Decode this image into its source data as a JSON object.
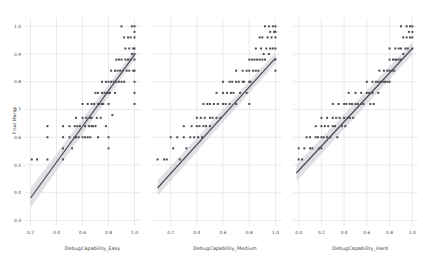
{
  "figure": {
    "background_color": "#ffffff",
    "grid_color": "#dcdce4",
    "point_color": "#4d4d55",
    "line_color": "#4a4a55",
    "ci_band_color": "#c9c9d0",
    "axis_text_color": "#4a4a4a",
    "ylabel": "Final Marks",
    "panel_count": 3
  },
  "chart_data": [
    {
      "type": "scatter",
      "title": "",
      "xlabel": "DebugCapability_Easy",
      "ylabel": "Final Marks",
      "xlim": [
        0.15,
        1.05
      ],
      "ylim": [
        0.28,
        1.03
      ],
      "xticks": [
        "0.2",
        "0.4",
        "0.6",
        "0.8",
        "1.0"
      ],
      "xtick_values": [
        0.2,
        0.4,
        0.6,
        0.8,
        1.0
      ],
      "yticks": [
        "0.3",
        "0.4",
        "0.5",
        "0.6",
        "0.7",
        "0.8",
        "0.9",
        "1.0"
      ],
      "ytick_values": [
        0.3,
        0.4,
        0.5,
        0.6,
        0.7,
        0.8,
        0.9,
        1.0
      ],
      "grid": true,
      "legend": "none",
      "regression": {
        "slope": 0.645,
        "intercept": 0.252,
        "ci_halfwidth_left": 0.035,
        "ci_halfwidth_right": 0.018,
        "x_start": 0.2,
        "x_end": 1.0
      },
      "x": [
        0.21,
        0.25,
        0.33,
        0.33,
        0.33,
        0.45,
        0.45,
        0.45,
        0.45,
        0.5,
        0.5,
        0.52,
        0.54,
        0.54,
        0.55,
        0.55,
        0.56,
        0.57,
        0.58,
        0.6,
        0.6,
        0.6,
        0.62,
        0.62,
        0.63,
        0.64,
        0.64,
        0.65,
        0.66,
        0.66,
        0.67,
        0.67,
        0.67,
        0.68,
        0.69,
        0.7,
        0.7,
        0.71,
        0.72,
        0.72,
        0.72,
        0.73,
        0.74,
        0.75,
        0.75,
        0.75,
        0.76,
        0.77,
        0.78,
        0.78,
        0.79,
        0.8,
        0.8,
        0.8,
        0.8,
        0.8,
        0.81,
        0.82,
        0.82,
        0.83,
        0.84,
        0.85,
        0.85,
        0.86,
        0.86,
        0.87,
        0.88,
        0.88,
        0.89,
        0.9,
        0.9,
        0.9,
        0.91,
        0.92,
        0.92,
        0.93,
        0.93,
        0.94,
        0.95,
        0.95,
        0.96,
        0.96,
        0.97,
        0.97,
        0.98,
        0.98,
        0.99,
        0.99,
        1.0,
        1.0,
        1.0,
        1.0,
        1.0,
        1.0,
        1.0,
        1.0,
        1.0,
        1.0
      ],
      "y": [
        0.52,
        0.52,
        0.52,
        0.64,
        0.6,
        0.52,
        0.56,
        0.6,
        0.64,
        0.6,
        0.64,
        0.56,
        0.6,
        0.64,
        0.6,
        0.67,
        0.64,
        0.6,
        0.64,
        0.6,
        0.67,
        0.72,
        0.6,
        0.64,
        0.67,
        0.6,
        0.72,
        0.64,
        0.6,
        0.67,
        0.64,
        0.67,
        0.72,
        0.64,
        0.72,
        0.64,
        0.76,
        0.67,
        0.6,
        0.72,
        0.76,
        0.72,
        0.67,
        0.72,
        0.76,
        0.8,
        0.72,
        0.76,
        0.64,
        0.8,
        0.76,
        0.56,
        0.6,
        0.72,
        0.76,
        0.8,
        0.76,
        0.8,
        0.84,
        0.68,
        0.8,
        0.76,
        0.84,
        0.8,
        0.88,
        0.84,
        0.8,
        0.88,
        0.84,
        0.8,
        0.88,
        1.0,
        0.84,
        0.8,
        0.96,
        0.88,
        0.92,
        0.84,
        0.88,
        0.96,
        0.84,
        0.92,
        0.88,
        0.96,
        0.9,
        1.0,
        0.84,
        0.92,
        0.72,
        0.76,
        0.8,
        0.84,
        0.88,
        0.9,
        0.92,
        0.96,
        0.98,
        1.0
      ]
    },
    {
      "type": "scatter",
      "title": "",
      "xlabel": "DebugCapability_Medium",
      "ylabel": "",
      "xlim": [
        0.05,
        1.05
      ],
      "ylim": [
        0.28,
        1.03
      ],
      "xticks": [
        "0.2",
        "0.4",
        "0.6",
        "0.8",
        "1.0"
      ],
      "xtick_values": [
        0.2,
        0.4,
        0.6,
        0.8,
        1.0
      ],
      "yticks": [],
      "ytick_values": [
        0.3,
        0.4,
        0.5,
        0.6,
        0.7,
        0.8,
        0.9,
        1.0
      ],
      "grid": true,
      "legend": "none",
      "regression": {
        "slope": 0.52,
        "intercept": 0.365,
        "ci_halfwidth_left": 0.028,
        "ci_halfwidth_right": 0.02,
        "x_start": 0.1,
        "x_end": 1.0
      },
      "x": [
        0.1,
        0.15,
        0.17,
        0.2,
        0.22,
        0.25,
        0.27,
        0.3,
        0.3,
        0.32,
        0.35,
        0.36,
        0.38,
        0.4,
        0.4,
        0.41,
        0.42,
        0.43,
        0.44,
        0.45,
        0.45,
        0.46,
        0.47,
        0.48,
        0.5,
        0.5,
        0.5,
        0.52,
        0.53,
        0.55,
        0.55,
        0.56,
        0.58,
        0.6,
        0.6,
        0.6,
        0.62,
        0.63,
        0.65,
        0.65,
        0.66,
        0.67,
        0.68,
        0.7,
        0.7,
        0.7,
        0.72,
        0.73,
        0.75,
        0.75,
        0.76,
        0.78,
        0.78,
        0.8,
        0.8,
        0.8,
        0.8,
        0.81,
        0.82,
        0.83,
        0.84,
        0.85,
        0.85,
        0.86,
        0.87,
        0.88,
        0.88,
        0.89,
        0.9,
        0.9,
        0.91,
        0.92,
        0.92,
        0.93,
        0.94,
        0.95,
        0.95,
        0.96,
        0.96,
        0.97,
        0.98,
        0.98,
        0.99,
        1.0,
        1.0,
        1.0,
        1.0,
        1.0,
        1.0
      ],
      "y": [
        0.52,
        0.52,
        0.52,
        0.6,
        0.56,
        0.6,
        0.52,
        0.64,
        0.6,
        0.56,
        0.6,
        0.64,
        0.6,
        0.64,
        0.67,
        0.6,
        0.64,
        0.67,
        0.6,
        0.64,
        0.72,
        0.67,
        0.64,
        0.72,
        0.64,
        0.67,
        0.72,
        0.67,
        0.72,
        0.67,
        0.76,
        0.72,
        0.67,
        0.72,
        0.76,
        0.8,
        0.72,
        0.76,
        0.72,
        0.8,
        0.76,
        0.8,
        0.76,
        0.72,
        0.8,
        0.84,
        0.8,
        0.76,
        0.8,
        0.84,
        0.8,
        0.76,
        0.84,
        0.72,
        0.8,
        0.84,
        0.88,
        0.8,
        0.88,
        0.84,
        0.88,
        0.84,
        0.92,
        0.88,
        0.84,
        0.88,
        0.96,
        0.92,
        0.88,
        0.96,
        0.9,
        0.88,
        1.0,
        0.92,
        0.96,
        0.9,
        1.0,
        0.92,
        0.98,
        0.96,
        0.92,
        1.0,
        0.98,
        0.84,
        0.88,
        0.92,
        0.96,
        0.98,
        1.0
      ]
    },
    {
      "type": "scatter",
      "title": "",
      "xlabel": "DebugCapability_Hard",
      "ylabel": "",
      "xlim": [
        -0.05,
        1.05
      ],
      "ylim": [
        0.28,
        1.03
      ],
      "xticks": [
        "0.0",
        "0.2",
        "0.4",
        "0.6",
        "0.8",
        "1.0"
      ],
      "xtick_values": [
        0.0,
        0.2,
        0.4,
        0.6,
        0.8,
        1.0
      ],
      "yticks": [],
      "ytick_values": [
        0.3,
        0.4,
        0.5,
        0.6,
        0.7,
        0.8,
        0.9,
        1.0
      ],
      "grid": true,
      "legend": "none",
      "regression": {
        "slope": 0.44,
        "intercept": 0.48,
        "ci_halfwidth_left": 0.03,
        "ci_halfwidth_right": 0.022,
        "x_start": -0.02,
        "x_end": 1.0
      },
      "x": [
        0.0,
        0.0,
        0.03,
        0.05,
        0.07,
        0.1,
        0.1,
        0.12,
        0.15,
        0.15,
        0.17,
        0.18,
        0.2,
        0.2,
        0.2,
        0.2,
        0.22,
        0.23,
        0.25,
        0.25,
        0.26,
        0.28,
        0.3,
        0.3,
        0.3,
        0.32,
        0.33,
        0.34,
        0.35,
        0.36,
        0.38,
        0.4,
        0.4,
        0.41,
        0.42,
        0.43,
        0.44,
        0.45,
        0.45,
        0.47,
        0.48,
        0.5,
        0.5,
        0.52,
        0.55,
        0.55,
        0.57,
        0.6,
        0.6,
        0.62,
        0.63,
        0.65,
        0.65,
        0.66,
        0.68,
        0.7,
        0.7,
        0.71,
        0.72,
        0.74,
        0.75,
        0.76,
        0.78,
        0.78,
        0.8,
        0.8,
        0.8,
        0.8,
        0.82,
        0.83,
        0.84,
        0.85,
        0.85,
        0.86,
        0.88,
        0.88,
        0.9,
        0.9,
        0.9,
        0.92,
        0.92,
        0.94,
        0.95,
        0.95,
        0.96,
        0.97,
        0.98,
        0.98,
        1.0,
        1.0,
        1.0,
        1.0
      ],
      "y": [
        0.52,
        0.56,
        0.52,
        0.56,
        0.6,
        0.56,
        0.6,
        0.56,
        0.6,
        0.64,
        0.6,
        0.56,
        0.56,
        0.6,
        0.64,
        0.67,
        0.6,
        0.64,
        0.6,
        0.67,
        0.64,
        0.6,
        0.64,
        0.67,
        0.72,
        0.64,
        0.67,
        0.6,
        0.72,
        0.67,
        0.64,
        0.67,
        0.72,
        0.64,
        0.72,
        0.67,
        0.76,
        0.67,
        0.72,
        0.72,
        0.67,
        0.72,
        0.76,
        0.72,
        0.72,
        0.76,
        0.72,
        0.76,
        0.8,
        0.76,
        0.72,
        0.76,
        0.8,
        0.72,
        0.8,
        0.76,
        0.8,
        0.84,
        0.8,
        0.8,
        0.84,
        0.8,
        0.84,
        0.8,
        0.8,
        0.84,
        0.88,
        0.92,
        0.84,
        0.88,
        0.84,
        0.88,
        0.92,
        0.88,
        0.88,
        0.92,
        0.88,
        0.92,
        1.0,
        0.9,
        0.96,
        0.92,
        0.96,
        1.0,
        0.92,
        0.98,
        0.96,
        1.0,
        0.92,
        0.96,
        0.98,
        1.0
      ]
    }
  ]
}
